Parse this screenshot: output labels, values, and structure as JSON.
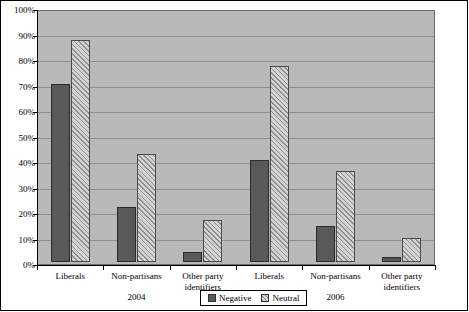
{
  "chart_data": {
    "type": "bar",
    "title": "",
    "subtitle": "",
    "xlabel": "",
    "ylabel": "",
    "ylim": [
      0,
      100
    ],
    "ytick_labels": [
      "100%",
      "90%",
      "80%",
      "70%",
      "60%",
      "50%",
      "40%",
      "30%",
      "20%",
      "10%",
      "0%"
    ],
    "ytick_values": [
      100,
      90,
      80,
      70,
      60,
      50,
      40,
      30,
      20,
      10,
      0
    ],
    "grid": true,
    "legend_position": "bottom-center",
    "group_labels": [
      "2004",
      "2006"
    ],
    "categories": [
      "Liberals",
      "Non-partisans",
      "Other party identifiers",
      "Liberals",
      "Non-partisans",
      "Other party identifiers"
    ],
    "category_lines": [
      [
        "Liberals"
      ],
      [
        "Non-partisans"
      ],
      [
        "Other party",
        "identifiers"
      ],
      [
        "Liberals"
      ],
      [
        "Non-partisans"
      ],
      [
        "Other party",
        "identifiers"
      ]
    ],
    "series": [
      {
        "name": "Negative",
        "color": "#595959",
        "fill": "solid",
        "values": [
          70,
          21.5,
          4,
          40,
          14,
          2
        ]
      },
      {
        "name": "Neutral",
        "color": "#d4d4d4",
        "fill": "diagonal-hatch",
        "values": [
          87,
          42.5,
          16.5,
          77,
          35.5,
          9.5
        ]
      }
    ]
  },
  "legend": {
    "items": [
      {
        "label": "Negative",
        "swatch": "solid-dark-swatch"
      },
      {
        "label": "Neutral",
        "swatch": "hatched-swatch"
      }
    ]
  },
  "colors": {
    "plot_background": "#b9b9b9",
    "gridline": "#8e8e8e",
    "axis": "#000000",
    "negative_bar": "#595959",
    "neutral_bar": "#d4d4d4",
    "page_background": "#ffffff"
  }
}
